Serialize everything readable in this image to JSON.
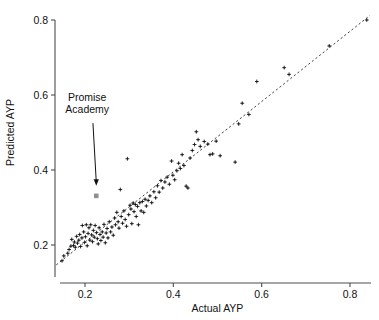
{
  "chart_data": {
    "type": "scatter",
    "title": "",
    "xlabel": "Actual AYP",
    "ylabel": "Predicted AYP",
    "xlim": [
      0.13,
      0.855
    ],
    "ylim": [
      0.135,
      0.815
    ],
    "xticks": [
      0.2,
      0.4,
      0.6,
      0.8
    ],
    "yticks": [
      0.2,
      0.4,
      0.6,
      0.8
    ],
    "xticklabels": [
      "0.2",
      "0.4",
      "0.6",
      "0.8"
    ],
    "yticklabels": [
      "0.2",
      "0.4",
      "0.6",
      "0.8"
    ],
    "grid": false,
    "legend": null,
    "reference_line": {
      "label": "identity line",
      "style": "dashed",
      "x": [
        0.135,
        0.845
      ],
      "y": [
        0.147,
        0.812
      ]
    },
    "annotations": [
      {
        "text_line_1": "Promise",
        "text_line_2": "Academy",
        "text_x": 0.205,
        "text_y": 0.585,
        "arrow_from_x": 0.218,
        "arrow_from_y": 0.525,
        "arrow_to_x": 0.2255,
        "arrow_to_y": 0.358
      }
    ],
    "highlight_point": {
      "name": "Promise Academy",
      "x": 0.2255,
      "y": 0.331,
      "marker": "square",
      "color": "#8f8f8f"
    },
    "series": [
      {
        "name": "schools",
        "marker": "plus",
        "color": "#1a1a1a",
        "points": [
          [
            0.148,
            0.158
          ],
          [
            0.152,
            0.171
          ],
          [
            0.161,
            0.178
          ],
          [
            0.164,
            0.188
          ],
          [
            0.168,
            0.197
          ],
          [
            0.17,
            0.215
          ],
          [
            0.174,
            0.199
          ],
          [
            0.176,
            0.208
          ],
          [
            0.178,
            0.194
          ],
          [
            0.181,
            0.223
          ],
          [
            0.183,
            0.205
          ],
          [
            0.186,
            0.213
          ],
          [
            0.188,
            0.228
          ],
          [
            0.19,
            0.196
          ],
          [
            0.193,
            0.219
          ],
          [
            0.194,
            0.252
          ],
          [
            0.197,
            0.235
          ],
          [
            0.199,
            0.207
          ],
          [
            0.201,
            0.222
          ],
          [
            0.203,
            0.254
          ],
          [
            0.205,
            0.198
          ],
          [
            0.207,
            0.231
          ],
          [
            0.209,
            0.246
          ],
          [
            0.211,
            0.213
          ],
          [
            0.213,
            0.254
          ],
          [
            0.215,
            0.227
          ],
          [
            0.217,
            0.209
          ],
          [
            0.219,
            0.239
          ],
          [
            0.221,
            0.221
          ],
          [
            0.223,
            0.252
          ],
          [
            0.226,
            0.233
          ],
          [
            0.228,
            0.217
          ],
          [
            0.23,
            0.203
          ],
          [
            0.232,
            0.246
          ],
          [
            0.234,
            0.228
          ],
          [
            0.236,
            0.212
          ],
          [
            0.239,
            0.235
          ],
          [
            0.241,
            0.221
          ],
          [
            0.243,
            0.255
          ],
          [
            0.246,
            0.206
          ],
          [
            0.248,
            0.232
          ],
          [
            0.25,
            0.244
          ],
          [
            0.252,
            0.219
          ],
          [
            0.255,
            0.262
          ],
          [
            0.258,
            0.235
          ],
          [
            0.261,
            0.248
          ],
          [
            0.264,
            0.226
          ],
          [
            0.267,
            0.272
          ],
          [
            0.269,
            0.254
          ],
          [
            0.272,
            0.287
          ],
          [
            0.275,
            0.262
          ],
          [
            0.277,
            0.245
          ],
          [
            0.28,
            0.348
          ],
          [
            0.282,
            0.276
          ],
          [
            0.285,
            0.258
          ],
          [
            0.288,
            0.291
          ],
          [
            0.291,
            0.268
          ],
          [
            0.294,
            0.25
          ],
          [
            0.296,
            0.43
          ],
          [
            0.299,
            0.281
          ],
          [
            0.302,
            0.306
          ],
          [
            0.304,
            0.296
          ],
          [
            0.306,
            0.257
          ],
          [
            0.309,
            0.312
          ],
          [
            0.311,
            0.289
          ],
          [
            0.314,
            0.308
          ],
          [
            0.316,
            0.276
          ],
          [
            0.319,
            0.303
          ],
          [
            0.321,
            0.254
          ],
          [
            0.324,
            0.313
          ],
          [
            0.327,
            0.291
          ],
          [
            0.33,
            0.316
          ],
          [
            0.333,
            0.287
          ],
          [
            0.336,
            0.322
          ],
          [
            0.339,
            0.304
          ],
          [
            0.343,
            0.319
          ],
          [
            0.347,
            0.331
          ],
          [
            0.351,
            0.313
          ],
          [
            0.356,
            0.342
          ],
          [
            0.36,
            0.326
          ],
          [
            0.364,
            0.358
          ],
          [
            0.368,
            0.341
          ],
          [
            0.372,
            0.372
          ],
          [
            0.376,
            0.352
          ],
          [
            0.381,
            0.368
          ],
          [
            0.386,
            0.381
          ],
          [
            0.391,
            0.362
          ],
          [
            0.396,
            0.424
          ],
          [
            0.399,
            0.386
          ],
          [
            0.403,
            0.374
          ],
          [
            0.408,
            0.398
          ],
          [
            0.412,
            0.418
          ],
          [
            0.416,
            0.404
          ],
          [
            0.42,
            0.441
          ],
          [
            0.424,
            0.412
          ],
          [
            0.429,
            0.357
          ],
          [
            0.433,
            0.352
          ],
          [
            0.438,
            0.432
          ],
          [
            0.443,
            0.452
          ],
          [
            0.448,
            0.468
          ],
          [
            0.452,
            0.502
          ],
          [
            0.456,
            0.481
          ],
          [
            0.461,
            0.463
          ],
          [
            0.47,
            0.476
          ],
          [
            0.478,
            0.469
          ],
          [
            0.483,
            0.441
          ],
          [
            0.489,
            0.443
          ],
          [
            0.497,
            0.477
          ],
          [
            0.506,
            0.438
          ],
          [
            0.54,
            0.421
          ],
          [
            0.548,
            0.523
          ],
          [
            0.556,
            0.578
          ],
          [
            0.571,
            0.548
          ],
          [
            0.589,
            0.636
          ],
          [
            0.651,
            0.673
          ],
          [
            0.662,
            0.655
          ],
          [
            0.753,
            0.731
          ],
          [
            0.838,
            0.8
          ]
        ]
      }
    ]
  }
}
